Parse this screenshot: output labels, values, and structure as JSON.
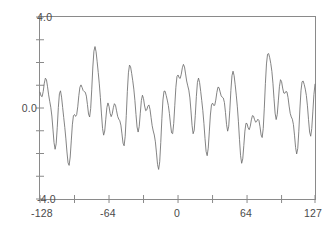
{
  "figure": {
    "background": "#ffffff",
    "frame_color": "#8a8a8a",
    "line_color": "#6e6e6e",
    "tick_color": "#8a8a8a",
    "label_color": "#4a4a4a"
  },
  "axis": {
    "y_top_label": "4.0",
    "y_mid_label": "0.0",
    "y_bottom_label": "-4.0",
    "x_labels": [
      "-128",
      "-64",
      "0",
      "64",
      "127"
    ]
  },
  "chart_data": {
    "type": "line",
    "title": "",
    "subtitle": "",
    "xlabel": "",
    "ylabel": "",
    "xlim": [
      -128,
      127
    ],
    "ylim": [
      -4.0,
      4.0
    ],
    "grid": false,
    "legend": "none",
    "x_tick_labels": [
      "-128",
      "-64",
      "0",
      "64",
      "127"
    ],
    "x_tick_values": [
      -128,
      -64,
      0,
      64,
      127
    ],
    "x_minor_tick_values": [
      -96,
      -32,
      32,
      96
    ],
    "y_tick_labels": [
      "4.0",
      "0.0",
      "-4.0"
    ],
    "y_tick_values": [
      4.0,
      0.0,
      -4.0
    ],
    "y_minor_tick_values": [
      3.0,
      2.0,
      1.0,
      -1.0,
      -2.0,
      -3.0
    ],
    "series": [
      {
        "name": "signal",
        "description": "Sum of sinusoids sampled at integer x from -128 to 127",
        "color": "#6e6e6e",
        "components": [
          {
            "amplitude": 1.0,
            "period_samples": 16.0,
            "phase_rad": 0.0
          },
          {
            "amplitude": 0.85,
            "period_samples": 42.0,
            "phase_rad": 1.1
          },
          {
            "amplitude": 0.6,
            "period_samples": 10.7,
            "phase_rad": 2.4
          },
          {
            "amplitude": 0.45,
            "period_samples": 85.0,
            "phase_rad": 0.6
          },
          {
            "amplitude": 0.3,
            "period_samples": 6.4,
            "phase_rad": 3.0
          }
        ],
        "x": [
          -128,
          -127,
          -126,
          -125,
          -124,
          -123,
          -122,
          -121,
          -120,
          -119,
          -118,
          -117,
          -116,
          -115,
          -114,
          -113,
          -112,
          -111,
          -110,
          -109,
          -108,
          -107,
          -106,
          -105,
          -104,
          -103,
          -102,
          -101,
          -100,
          -99,
          -98,
          -97,
          -96,
          -95,
          -94,
          -93,
          -92,
          -91,
          -90,
          -89,
          -88,
          -87,
          -86,
          -85,
          -84,
          -83,
          -82,
          -81,
          -80,
          -79,
          -78,
          -77,
          -76,
          -75,
          -74,
          -73,
          -72,
          -71,
          -70,
          -69,
          -68,
          -67,
          -66,
          -65,
          -64,
          -63,
          -62,
          -61,
          -60,
          -59,
          -58,
          -57,
          -56,
          -55,
          -54,
          -53,
          -52,
          -51,
          -50,
          -49,
          -48,
          -47,
          -46,
          -45,
          -44,
          -43,
          -42,
          -41,
          -40,
          -39,
          -38,
          -37,
          -36,
          -35,
          -34,
          -33,
          -32,
          -31,
          -30,
          -29,
          -28,
          -27,
          -26,
          -25,
          -24,
          -23,
          -22,
          -21,
          -20,
          -19,
          -18,
          -17,
          -16,
          -15,
          -14,
          -13,
          -12,
          -11,
          -10,
          -9,
          -8,
          -7,
          -6,
          -5,
          -4,
          -3,
          -2,
          -1,
          0,
          1,
          2,
          3,
          4,
          5,
          6,
          7,
          8,
          9,
          10,
          11,
          12,
          13,
          14,
          15,
          16,
          17,
          18,
          19,
          20,
          21,
          22,
          23,
          24,
          25,
          26,
          27,
          28,
          29,
          30,
          31,
          32,
          33,
          34,
          35,
          36,
          37,
          38,
          39,
          40,
          41,
          42,
          43,
          44,
          45,
          46,
          47,
          48,
          49,
          50,
          51,
          52,
          53,
          54,
          55,
          56,
          57,
          58,
          59,
          60,
          61,
          62,
          63,
          64,
          65,
          66,
          67,
          68,
          69,
          70,
          71,
          72,
          73,
          74,
          75,
          76,
          77,
          78,
          79,
          80,
          81,
          82,
          83,
          84,
          85,
          86,
          87,
          88,
          89,
          90,
          91,
          92,
          93,
          94,
          95,
          96,
          97,
          98,
          99,
          100,
          101,
          102,
          103,
          104,
          105,
          106,
          107,
          108,
          109,
          110,
          111,
          112,
          113,
          114,
          115,
          116,
          117,
          118,
          119,
          120,
          121,
          122,
          123,
          124,
          125,
          126,
          127
        ],
        "y_range_observed": [
          -2.7,
          2.7
        ],
        "approx_peaks": [
          {
            "x": -118,
            "y": 2.65
          },
          {
            "x": -104,
            "y": 1.35
          },
          {
            "x": -92,
            "y": 1.1
          },
          {
            "x": -80,
            "y": 2.0
          },
          {
            "x": -62,
            "y": 2.3
          },
          {
            "x": -48,
            "y": 2.2
          },
          {
            "x": -34,
            "y": 1.55
          },
          {
            "x": -20,
            "y": 0.95
          },
          {
            "x": -4,
            "y": 2.65
          },
          {
            "x": 10,
            "y": 1.5
          },
          {
            "x": 22,
            "y": 1.1
          },
          {
            "x": 34,
            "y": 2.55
          },
          {
            "x": 52,
            "y": 1.05
          },
          {
            "x": 66,
            "y": 1.75
          },
          {
            "x": 80,
            "y": 1.9
          },
          {
            "x": 96,
            "y": 2.6
          },
          {
            "x": 112,
            "y": 0.65
          },
          {
            "x": 122,
            "y": 0.85
          }
        ],
        "approx_troughs": [
          {
            "x": -124,
            "y": -1.85
          },
          {
            "x": -112,
            "y": -2.1
          },
          {
            "x": -98,
            "y": -1.2
          },
          {
            "x": -86,
            "y": -1.0
          },
          {
            "x": -72,
            "y": -2.55
          },
          {
            "x": -56,
            "y": -1.45
          },
          {
            "x": -42,
            "y": -1.6
          },
          {
            "x": -28,
            "y": -0.75
          },
          {
            "x": -14,
            "y": -2.6
          },
          {
            "x": 2,
            "y": -1.0
          },
          {
            "x": 16,
            "y": -1.0
          },
          {
            "x": 28,
            "y": -1.2
          },
          {
            "x": 44,
            "y": -2.6
          },
          {
            "x": 58,
            "y": -1.1
          },
          {
            "x": 74,
            "y": -1.05
          },
          {
            "x": 88,
            "y": -1.5
          },
          {
            "x": 104,
            "y": -2.45
          },
          {
            "x": 118,
            "y": -0.85
          }
        ]
      }
    ]
  }
}
